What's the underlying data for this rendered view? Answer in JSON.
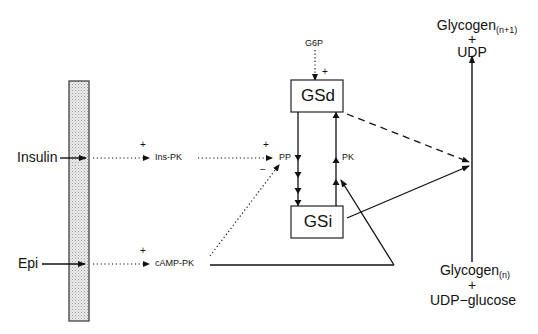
{
  "diagram": {
    "title": "",
    "membrane": {
      "label": "",
      "fill": "#e6e6e6"
    },
    "signals": {
      "insulin": "Insulin",
      "epi": "Epi"
    },
    "kinases": {
      "ins_pk": "Ins-PK",
      "camp_pk": "cAMP-PK"
    },
    "enzymes": {
      "pp": "PP",
      "pk": "PK",
      "g6p": "G6P"
    },
    "boxes": {
      "gsd": "GSd",
      "gsi": "GSi"
    },
    "signs": {
      "plus_insulin": "+",
      "plus_epi": "+",
      "plus_pp": "+",
      "minus_pp": "−",
      "plus_g6p": "+"
    },
    "products": {
      "top_main": "Glycogen",
      "top_sub": "(n+1)",
      "top_plus": "+",
      "top_second": "UDP"
    },
    "substrates": {
      "bottom_main": "Glycogen",
      "bottom_sub": "(n)",
      "bottom_plus": "+",
      "bottom_second": "UDP−glucose"
    },
    "edges": [
      {
        "from": "Insulin",
        "to": "membrane",
        "style": "solid"
      },
      {
        "from": "Epi",
        "to": "membrane",
        "style": "solid"
      },
      {
        "from": "membrane",
        "to": "Ins-PK",
        "style": "dotted",
        "sign": "+"
      },
      {
        "from": "membrane",
        "to": "cAMP-PK",
        "style": "dotted",
        "sign": "+"
      },
      {
        "from": "Ins-PK",
        "to": "PP",
        "style": "dotted",
        "sign": "+"
      },
      {
        "from": "cAMP-PK",
        "to": "PP",
        "style": "dotted",
        "sign": "−"
      },
      {
        "from": "G6P",
        "to": "GSd",
        "style": "dotted",
        "sign": "+"
      },
      {
        "from": "GSd",
        "to": "GSi",
        "style": "solid",
        "via": "PP"
      },
      {
        "from": "GSi",
        "to": "GSd",
        "style": "solid",
        "via": "PK"
      },
      {
        "from": "cAMP-PK",
        "to": "PK",
        "style": "solid"
      },
      {
        "from": "GSd",
        "to": "Glycogen synthesis",
        "style": "dashed"
      },
      {
        "from": "GSi",
        "to": "Glycogen synthesis",
        "style": "solid"
      },
      {
        "from": "Glycogen(n) + UDP-glucose",
        "to": "Glycogen(n+1) + UDP",
        "style": "solid"
      }
    ]
  }
}
